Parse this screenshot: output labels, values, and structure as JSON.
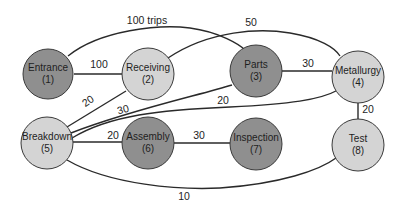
{
  "diagram": {
    "type": "flow-network",
    "nodes": [
      {
        "id": 1,
        "name": "Entrance",
        "number": "(1)",
        "shade": "dark"
      },
      {
        "id": 2,
        "name": "Receiving",
        "number": "(2)",
        "shade": "light"
      },
      {
        "id": 3,
        "name": "Parts",
        "number": "(3)",
        "shade": "dark"
      },
      {
        "id": 4,
        "name": "Metallurgy",
        "number": "(4)",
        "shade": "light"
      },
      {
        "id": 5,
        "name": "Breakdown",
        "number": "(5)",
        "shade": "light"
      },
      {
        "id": 6,
        "name": "Assembly",
        "number": "(6)",
        "shade": "dark"
      },
      {
        "id": 7,
        "name": "Inspection",
        "number": "(7)",
        "shade": "dark"
      },
      {
        "id": 8,
        "name": "Test",
        "number": "(8)",
        "shade": "light"
      }
    ],
    "edges": [
      {
        "from": 1,
        "to": 2,
        "label": "100"
      },
      {
        "from": 1,
        "to": 3,
        "label": "100 trips"
      },
      {
        "from": 2,
        "to": 4,
        "label": "50"
      },
      {
        "from": 3,
        "to": 4,
        "label": "30"
      },
      {
        "from": 2,
        "to": 5,
        "label": "20"
      },
      {
        "from": 5,
        "to": 3,
        "label": "30"
      },
      {
        "from": 5,
        "to": 4,
        "label": "20"
      },
      {
        "from": 4,
        "to": 8,
        "label": "20"
      },
      {
        "from": 5,
        "to": 6,
        "label": "20"
      },
      {
        "from": 6,
        "to": 7,
        "label": "30"
      },
      {
        "from": 5,
        "to": 8,
        "label": "10"
      }
    ],
    "colors": {
      "dark_node": "#8f8f8f",
      "light_node": "#d4d4d4",
      "line": "#2a2a2a"
    }
  }
}
